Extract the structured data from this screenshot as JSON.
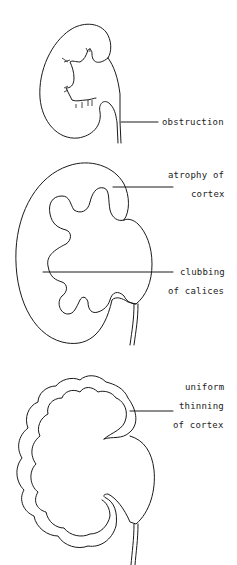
{
  "figure": {
    "panels": [
      {
        "id": "obstruction",
        "labels": [
          "obstruction"
        ]
      },
      {
        "id": "atrophy-clubbing",
        "labels": [
          "atrophy of",
          "cortex",
          "clubbing",
          "of calices"
        ]
      },
      {
        "id": "uniform-thinning",
        "labels": [
          "uniform",
          "thinning",
          "of cortex"
        ]
      }
    ]
  },
  "colors": {
    "ink": "#1a1a1a",
    "background": "#ffffff"
  }
}
